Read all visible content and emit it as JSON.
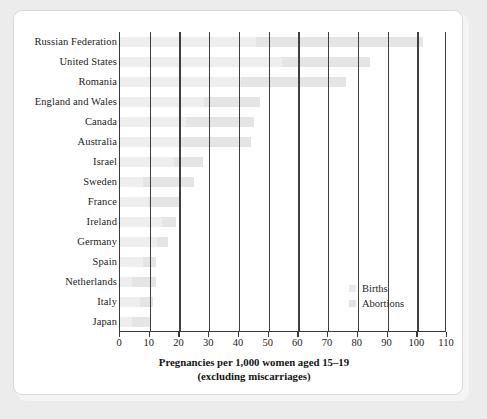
{
  "chart_data": {
    "type": "bar",
    "orientation": "horizontal",
    "stacked": true,
    "title": "",
    "xlabel": "Pregnancies per 1,000 women aged 15–19\n(excluding miscarriages)",
    "xlabel_line1": "Pregnancies per 1,000 women aged 15–19",
    "xlabel_line2": "(excluding miscarriages)",
    "ylabel": "",
    "xlim": [
      0,
      110
    ],
    "xticks": [
      0,
      10,
      20,
      30,
      40,
      50,
      60,
      70,
      80,
      90,
      100,
      110
    ],
    "xticklabels": [
      "0",
      "10",
      "20",
      "30",
      "40",
      "50",
      "60",
      "70",
      "80",
      "90",
      "100",
      "110"
    ],
    "grid": "vertical",
    "legend_position": "inside-lower-right",
    "categories": [
      "Russian Federation",
      "United States",
      "Romania",
      "England and Wales",
      "Canada",
      "Australia",
      "Israel",
      "Sweden",
      "France",
      "Ireland",
      "Germany",
      "Spain",
      "Netherlands",
      "Italy",
      "Japan"
    ],
    "series": [
      {
        "name": "Births",
        "color": "#eeeeee",
        "values": [
          45.6,
          54.4,
          40.6,
          28.4,
          22.3,
          20.1,
          18.0,
          7.7,
          9.4,
          14.2,
          12.5,
          7.9,
          4.1,
          6.6,
          3.9
        ]
      },
      {
        "name": "Abortions",
        "color": "#e5e5e5",
        "values": [
          56.4,
          29.6,
          35.4,
          18.6,
          22.7,
          23.9,
          10.0,
          17.3,
          10.6,
          4.8,
          3.5,
          4.1,
          7.9,
          4.4,
          6.6
        ]
      }
    ],
    "totals": [
      102,
      84,
      76,
      47,
      45,
      44,
      28,
      25,
      20,
      19,
      16,
      12,
      12,
      11,
      10.5
    ]
  },
  "legend": {
    "items": [
      {
        "label": "Births",
        "swatch_color": "#ebebeb"
      },
      {
        "label": "Abortions",
        "swatch_color": "#e3e3e3"
      }
    ]
  },
  "colors": {
    "page_background": "#ececec",
    "card_background": "#ffffff",
    "axis": "#3a3a3a",
    "gridline": "#3f3f3f",
    "text": "#1c1c1c"
  }
}
